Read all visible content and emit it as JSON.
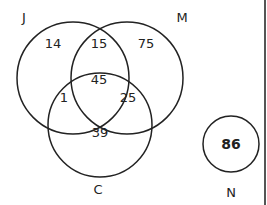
{
  "diagram": {
    "type": "venn",
    "sets": [
      {
        "name": "J",
        "label": "J"
      },
      {
        "name": "M",
        "label": "M"
      },
      {
        "name": "C",
        "label": "C"
      },
      {
        "name": "N",
        "label": "N"
      }
    ],
    "regions": {
      "J_only": "14",
      "J_M": "15",
      "M_only": "75",
      "J_M_C": "45",
      "J_C": "1",
      "M_C": "25",
      "C_only": "39",
      "N_only": "86"
    },
    "colors": {
      "stroke": "#222222",
      "background": "#ffffff"
    }
  }
}
